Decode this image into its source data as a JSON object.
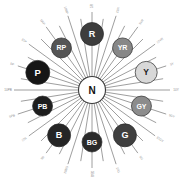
{
  "diagram": {
    "background": "#ffffff",
    "spoke_color": "#4d4d4d",
    "tick_color": "#8a8a8a",
    "center": {
      "label": "N",
      "name": "Neutral",
      "fill": "#ffffff",
      "stroke": "#3a3a3a",
      "radius": 13.5,
      "cx": 92,
      "cy": 90
    },
    "hues": [
      {
        "label": "R",
        "angle": -90,
        "radius": 56,
        "fill": "#3d3d3d",
        "text": "#ffffff",
        "size": 11.5,
        "font": 9
      },
      {
        "label": "YR",
        "angle": -54,
        "radius": 52,
        "fill": "#878787",
        "text": "#ffffff",
        "size": 10.0,
        "font": 7
      },
      {
        "label": "Y",
        "angle": -18,
        "radius": 57,
        "fill": "#d8d8d8",
        "text": "#1a1a1a",
        "size": 11.0,
        "font": 8.5
      },
      {
        "label": "GY",
        "angle": 18,
        "radius": 52,
        "fill": "#8c8c8c",
        "text": "#ffffff",
        "size": 10.0,
        "font": 7
      },
      {
        "label": "G",
        "angle": 54,
        "radius": 56,
        "fill": "#3f3f3f",
        "text": "#ffffff",
        "size": 11.5,
        "font": 9
      },
      {
        "label": "BG",
        "angle": 90,
        "radius": 52,
        "fill": "#2a2a2a",
        "text": "#ffffff",
        "size": 10.0,
        "font": 7
      },
      {
        "label": "B",
        "angle": 126,
        "radius": 56,
        "fill": "#252525",
        "text": "#ffffff",
        "size": 11.5,
        "font": 9
      },
      {
        "label": "PB",
        "angle": 162,
        "radius": 52,
        "fill": "#1e1e1e",
        "text": "#ffffff",
        "size": 10.0,
        "font": 7
      },
      {
        "label": "P",
        "angle": -162,
        "radius": 57,
        "fill": "#161616",
        "text": "#ffffff",
        "size": 12.0,
        "font": 9.5
      },
      {
        "label": "RP",
        "angle": -126,
        "radius": 52,
        "fill": "#555555",
        "text": "#ffffff",
        "size": 10.0,
        "font": 7
      }
    ],
    "ticks": [
      {
        "label": "5R",
        "angle": -90
      },
      {
        "label": "10R",
        "angle": -72
      },
      {
        "label": "5YR",
        "angle": -54
      },
      {
        "label": "10YR",
        "angle": -36
      },
      {
        "label": "5Y",
        "angle": -18
      },
      {
        "label": "10Y",
        "angle": 0
      },
      {
        "label": "5GY",
        "angle": 18
      },
      {
        "label": "10GY",
        "angle": 36
      },
      {
        "label": "5G",
        "angle": 54
      },
      {
        "label": "10G",
        "angle": 72
      },
      {
        "label": "5BG",
        "angle": 90
      },
      {
        "label": "10BG",
        "angle": 108
      },
      {
        "label": "5B",
        "angle": 126
      },
      {
        "label": "10B",
        "angle": 144
      },
      {
        "label": "5PB",
        "angle": 162
      },
      {
        "label": "10PB",
        "angle": 180
      },
      {
        "label": "5P",
        "angle": -162
      },
      {
        "label": "10P",
        "angle": -144
      },
      {
        "label": "5RP",
        "angle": -126
      },
      {
        "label": "10RP",
        "angle": -108
      }
    ]
  }
}
